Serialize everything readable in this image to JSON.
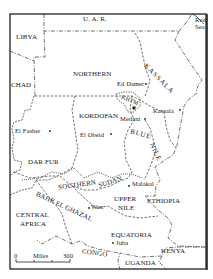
{
  "map": {
    "title": "Sudan provinces map",
    "colors": {
      "ink": "#222222",
      "background": "#ffffff"
    },
    "countries": [
      {
        "name": "U. A. R.",
        "x": 83,
        "y": 18
      },
      {
        "name": "LIBYA",
        "x": 16,
        "y": 34
      },
      {
        "name": "CHAD",
        "x": 12,
        "y": 82
      },
      {
        "name": "CENTRAL",
        "x": 16,
        "y": 211
      },
      {
        "name": "AFRICA",
        "x": 20,
        "y": 219
      },
      {
        "name": "CONGO",
        "x": 82,
        "y": 249
      },
      {
        "name": "UGANDA",
        "x": 125,
        "y": 259
      },
      {
        "name": "KENYA",
        "x": 161,
        "y": 247
      },
      {
        "name": "ETHIOPIA",
        "x": 146,
        "y": 196
      },
      {
        "name": "Red",
        "x": 197,
        "y": 17
      },
      {
        "name": "Sea",
        "x": 197,
        "y": 24
      }
    ],
    "provinces": [
      {
        "name": "NORTHERN",
        "x": 73,
        "y": 70
      },
      {
        "name": "KASSALA",
        "x": 150,
        "y": 58,
        "rotate": 40
      },
      {
        "name": "KORDOFAN",
        "x": 80,
        "y": 114
      },
      {
        "name": "KHTM",
        "x": 124,
        "y": 97,
        "rotate": 20
      },
      {
        "name": "BLUE",
        "x": 132,
        "y": 130,
        "rotate": 15
      },
      {
        "name": "NILE",
        "x": 150,
        "y": 146,
        "rotate": 60
      },
      {
        "name": "DAR FUR",
        "x": 28,
        "y": 159
      },
      {
        "name": "SOUTHERN",
        "x": 60,
        "y": 178,
        "rotate": -10
      },
      {
        "name": "SUDAN",
        "x": 100,
        "y": 179,
        "rotate": -15
      },
      {
        "name": "BAHR EL GHAZAL",
        "x": 44,
        "y": 190,
        "rotate": 25
      },
      {
        "name": "UPPER",
        "x": 114,
        "y": 196
      },
      {
        "name": "NILE",
        "x": 118,
        "y": 204
      },
      {
        "name": "EQUATORIA",
        "x": 111,
        "y": 232
      }
    ],
    "cities": [
      {
        "name": "Ed Damer",
        "x": 118,
        "y": 80,
        "dot_x": 146,
        "dot_y": 84
      },
      {
        "name": "Kassala",
        "x": 154,
        "y": 106,
        "dot_x": 180,
        "dot_y": 110
      },
      {
        "name": "Medani",
        "x": 121,
        "y": 115,
        "dot_x": 145,
        "dot_y": 119
      },
      {
        "name": "El Fasher",
        "x": 15,
        "y": 127,
        "dot_x": 50,
        "dot_y": 131
      },
      {
        "name": "El Obeid",
        "x": 80,
        "y": 131,
        "dot_x": 111,
        "dot_y": 134
      },
      {
        "name": "Malakal",
        "x": 132,
        "y": 181,
        "dot_x": 129,
        "dot_y": 186
      },
      {
        "name": "Wan",
        "x": 92,
        "y": 205,
        "dot_x": 89,
        "dot_y": 208
      },
      {
        "name": "Juba",
        "x": 116,
        "y": 240,
        "dot_x": 113,
        "dot_y": 243
      }
    ],
    "capital": {
      "x": 134,
      "y": 108
    },
    "scale_bar": {
      "start_label": "0",
      "unit_label": "Miles",
      "end_label": "300"
    }
  }
}
